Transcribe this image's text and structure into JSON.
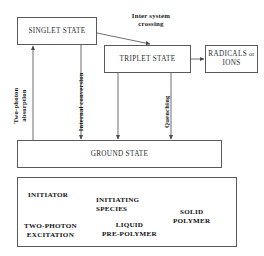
{
  "diagram": {
    "boxes": {
      "singlet": "SINGLET STATE",
      "triplet": "TRIPLET STATE",
      "radicals_line1": "RADICALS",
      "radicals_or": "or",
      "radicals_line2": "IONS",
      "ground": "GROUND STATE"
    },
    "transitions": {
      "inter_system_crossing_line1": "Inter system",
      "inter_system_crossing_line2": "crossing",
      "two_photon_absorption_line1": "Two-photon",
      "two_photon_absorption_line2": "absorption",
      "internal_conversion": "Internal conversion",
      "quenching": "Quenching"
    },
    "process_panel": {
      "initiator": "INITIATOR",
      "two_photon_excitation_line1": "TWO-PHOTON",
      "two_photon_excitation_line2": "EXCITATION",
      "initiating_species_line1": "INITIATING",
      "initiating_species_line2": "SPECIES",
      "liquid_prepolymer_line1": "LIQUID",
      "liquid_prepolymer_line2": "PRE-POLYMER",
      "solid_polymer_line1": "SOLID",
      "solid_polymer_line2": "POLYMER"
    },
    "colors": {
      "stroke": "#5a5a5a",
      "text": "#1a1a1a",
      "background": "#ffffff",
      "arrow": "#4a4a4a"
    }
  }
}
